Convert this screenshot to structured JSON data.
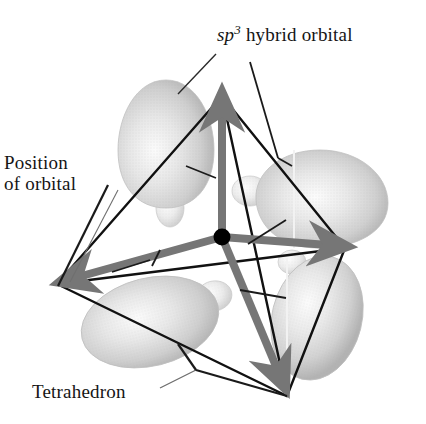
{
  "figure": {
    "title_text": "sp3 hybrid orbital tetrahedron",
    "background_color": "#ffffff",
    "labels": {
      "sp3_prefix": "sp",
      "sp3_superscript": "3",
      "sp3_suffix": " hybrid orbital",
      "sp3_full": "sp3 hybrid orbital",
      "position_line1": "Position",
      "position_line2": "of orbital",
      "tetrahedron": "Tetrahedron"
    },
    "colors": {
      "label_text": "#151515",
      "leader_line": "#1a1a1a",
      "leader_line_thin": "#6f6f6f",
      "tetrahedron_edge": "#111111",
      "arrow": "#767676",
      "arrow_dark": "#6a6a6a",
      "center_dot": "#000000",
      "orbital_fill_light": "#f3f3f3",
      "orbital_fill_mid": "#d6d6d6",
      "orbital_fill_dark": "#b4b4b4",
      "orbital_outline": "#c2c2c2"
    },
    "geometry": {
      "center": {
        "x": 222,
        "y": 237
      },
      "center_dot_radius": 8,
      "tetrahedron_vertices": [
        {
          "name": "top",
          "x": 222,
          "y": 96
        },
        {
          "name": "left",
          "x": 57,
          "y": 284
        },
        {
          "name": "right",
          "x": 345,
          "y": 248
        },
        {
          "name": "bottom",
          "x": 287,
          "y": 396
        }
      ],
      "arrows": [
        {
          "name": "arrow-up",
          "from_x": 222,
          "from_y": 237,
          "to_x": 222,
          "to_y": 100
        },
        {
          "name": "arrow-left",
          "from_x": 222,
          "from_y": 237,
          "to_x": 64,
          "to_y": 281
        },
        {
          "name": "arrow-right",
          "from_x": 222,
          "from_y": 237,
          "to_x": 341,
          "to_y": 246
        },
        {
          "name": "arrow-down-right",
          "from_x": 222,
          "from_y": 237,
          "to_x": 284,
          "to_y": 386
        }
      ],
      "orbitals": [
        {
          "name": "orbital-upper-left",
          "cx": 166,
          "cy": 143,
          "rx": 47,
          "ry": 62,
          "rotation": -4,
          "back_lobe": {
            "cx": 170,
            "cy": 208,
            "rx": 14,
            "ry": 18,
            "rotation": 0
          }
        },
        {
          "name": "orbital-right",
          "cx": 315,
          "cy": 198,
          "rx": 68,
          "ry": 46,
          "rotation": 6,
          "back_lobe": {
            "cx": 249,
            "cy": 190,
            "rx": 17,
            "ry": 14,
            "rotation": 0
          }
        },
        {
          "name": "orbital-lower-left",
          "cx": 150,
          "cy": 320,
          "rx": 66,
          "ry": 44,
          "rotation": -15,
          "back_lobe": {
            "cx": 213,
            "cy": 296,
            "rx": 17,
            "ry": 14,
            "rotation": 0
          }
        },
        {
          "name": "orbital-lower-right",
          "cx": 317,
          "cy": 316,
          "rx": 44,
          "ry": 62,
          "rotation": 16,
          "back_lobe": {
            "cx": 291,
            "cy": 259,
            "rx": 14,
            "ry": 12,
            "rotation": 0
          }
        }
      ],
      "leader_lines": [
        {
          "name": "leader-sp3",
          "x1": 214,
          "y1": 54,
          "x2": 178,
          "y2": 93
        },
        {
          "name": "leader-sp3-orbital",
          "x1": 249,
          "y1": 65,
          "x2": 275,
          "y2": 155
        },
        {
          "name": "leader-sp3-right-orbital",
          "x1": 222,
          "y1": 96,
          "x2": 268,
          "y2": 160
        },
        {
          "name": "leader-position-1",
          "x1": 110,
          "y1": 188,
          "x2": 62,
          "y2": 280
        },
        {
          "name": "leader-position-2",
          "x1": 120,
          "y1": 196,
          "x2": 70,
          "y2": 282
        },
        {
          "name": "leader-tetrahedron",
          "x1": 166,
          "y1": 388,
          "x2": 196,
          "y2": 372
        }
      ]
    }
  }
}
